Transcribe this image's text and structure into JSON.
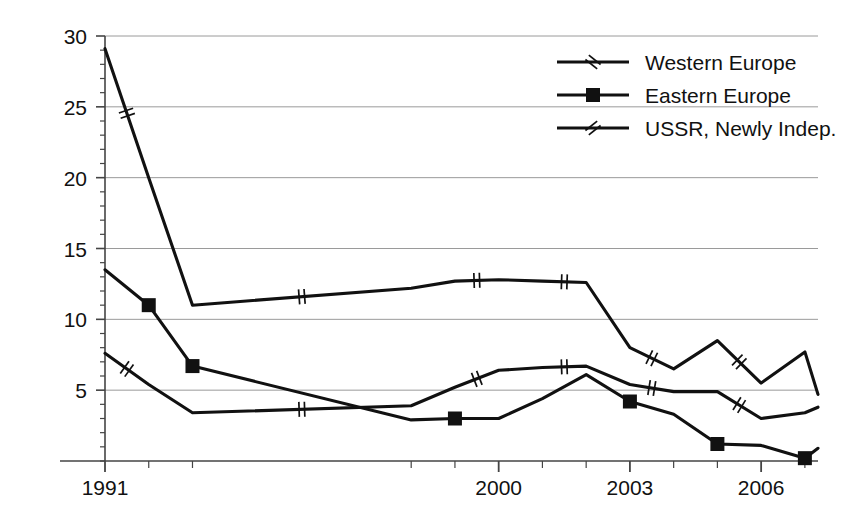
{
  "chart_data": {
    "type": "line",
    "title": "",
    "xlabel": "",
    "ylabel": "",
    "xlim": [
      1991,
      2007.3
    ],
    "ylim": [
      0,
      30
    ],
    "yticks": [
      5,
      10,
      15,
      20,
      25,
      30
    ],
    "ytick_labels": [
      "5",
      "10",
      "15",
      "20",
      "25",
      "30"
    ],
    "y_minor_tick_step": 1,
    "xticks": [
      1991,
      1992,
      1993,
      1998,
      1999,
      2000,
      2001,
      2002,
      2003,
      2004,
      2005,
      2006,
      2007
    ],
    "xtick_labels": [
      "1991",
      "2000",
      "2003",
      "2006"
    ],
    "xtick_label_values": [
      1991,
      2000,
      2003,
      2006
    ],
    "grid": "horizontal",
    "legend_position": "top-right",
    "x": [
      1991,
      1992,
      1993,
      1998,
      1999,
      2000,
      2001,
      2002,
      2003,
      2004,
      2005,
      2006,
      2007,
      2007.3
    ],
    "series": [
      {
        "name": "USSR, Newly Indep.",
        "marker": "double-slash",
        "values": [
          29.1,
          20.0,
          11.0,
          12.2,
          12.7,
          12.8,
          12.7,
          12.6,
          8.0,
          6.5,
          8.5,
          5.5,
          7.7,
          4.7
        ]
      },
      {
        "name": "Western Europe",
        "marker": "double-slash",
        "values": [
          7.6,
          5.4,
          3.4,
          3.9,
          5.2,
          6.4,
          6.6,
          6.7,
          5.4,
          4.9,
          4.9,
          3.0,
          3.4,
          3.8
        ]
      },
      {
        "name": "Eastern Europe",
        "marker": "square",
        "values": [
          13.5,
          11.0,
          6.7,
          2.9,
          3.0,
          3.0,
          4.4,
          6.1,
          4.2,
          3.3,
          1.2,
          1.1,
          0.2,
          0.9
        ],
        "marker_x": [
          1992,
          1993,
          1999,
          2003,
          2005,
          2007
        ]
      }
    ],
    "legend": [
      {
        "label": "Western Europe",
        "marker": "double-slash"
      },
      {
        "label": "Eastern Europe",
        "marker": "square"
      },
      {
        "label": "USSR, Newly Indep.",
        "marker": "double-slash"
      }
    ],
    "colors": {
      "line": "#111111",
      "grid": "#9a9a9a",
      "axis": "#444444",
      "background": "#ffffff"
    }
  },
  "caption": {
    "text": ""
  }
}
